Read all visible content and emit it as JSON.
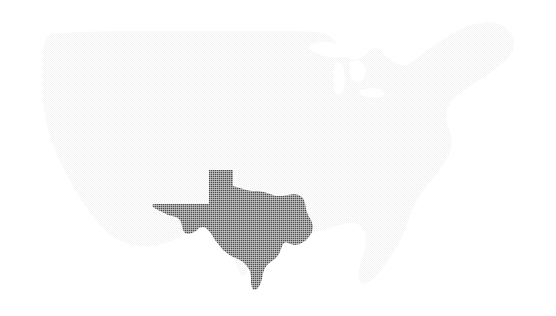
{
  "figure": {
    "name": "us-map-texas-highlighted",
    "background_color": "#ffffff",
    "width": 556,
    "height": 316,
    "texture": "halftone-screen",
    "visible_text": []
  },
  "regions": {
    "base": {
      "name": "contiguous-united-states",
      "label": "Contiguous United States",
      "fill_color": "#ececec",
      "stroke_color": "none",
      "highlighted": false
    },
    "highlight": {
      "name": "texas",
      "label": "Texas",
      "fill_color": "#4d4d4d",
      "stroke_color": "none",
      "highlighted": true
    },
    "lakes": {
      "name": "great-lakes",
      "label": "Great Lakes",
      "fill_color": "#ffffff"
    }
  },
  "legend": {
    "present": false,
    "items": [
      {
        "swatch_color": "#4d4d4d",
        "label": "Texas"
      },
      {
        "swatch_color": "#ececec",
        "label": "Other states"
      }
    ]
  },
  "geometry": {
    "usa_outline": "M 44 46 L 46 38 L 52 34 L 61 33 L 78 32 L 110 31 L 150 31 L 200 31 L 250 31 L 300 31 L 318 32 L 330 36 L 336 42 L 340 49 L 344 56 L 352 60 L 361 58 L 368 52 L 374 48 L 381 50 L 386 57 L 393 62 L 404 66 L 412 62 L 420 56 L 430 48 L 441 41 L 452 34 L 463 28 L 474 24 L 486 22 L 497 23 L 505 27 L 511 33 L 514 41 L 513 50 L 508 58 L 500 65 L 491 72 L 481 79 L 470 86 L 460 93 L 452 100 L 447 108 L 446 117 L 448 126 L 451 135 L 452 145 L 449 155 L 444 164 L 437 173 L 430 182 L 423 191 L 417 200 L 412 210 L 408 221 L 404 232 L 399 243 L 393 253 L 387 262 L 381 270 L 375 277 L 369 282 L 364 284 L 360 282 L 358 276 L 359 268 L 362 259 L 365 249 L 366 240 L 365 232 L 361 226 L 355 223 L 348 223 L 340 225 L 331 228 L 321 231 L 311 233 L 301 234 L 291 234 L 282 233 L 274 231 L 267 228 L 261 224 L 256 220 L 252 216 L 249 213 L 247 211 L 246 213 L 247 219 L 249 227 L 251 236 L 252 245 L 252 254 L 251 262 L 249 269 L 246 274 L 243 276 L 240 274 L 238 269 L 236 262 L 234 254 L 231 246 L 227 239 L 222 233 L 216 229 L 209 227 L 202 227 L 195 229 L 188 232 L 181 236 L 174 240 L 166 243 L 158 245 L 150 246 L 142 246 L 134 245 L 126 243 L 119 240 L 112 236 L 106 231 L 100 225 L 94 218 L 88 210 L 82 201 L 76 191 L 70 180 L 64 169 L 58 157 L 53 145 L 49 133 L 46 121 L 44 109 L 43 97 L 43 85 L 43 73 L 43 61 Z",
    "texas": "M 209 170 L 233 170 L 233 186 L 240 188 L 246 190 L 252 191 L 258 191 L 264 192 L 270 194 L 276 196 L 282 196 L 288 195 L 294 194 L 299 195 L 303 198 L 305 203 L 306 209 L 308 215 L 311 220 L 313 226 L 312 232 L 309 237 L 305 241 L 300 244 L 295 245 L 290 244 L 286 242 L 283 244 L 281 249 L 279 254 L 276 258 L 272 261 L 268 264 L 265 268 L 263 273 L 262 279 L 260 285 L 257 289 L 254 290 L 252 288 L 251 283 L 251 277 L 250 271 L 247 266 L 243 262 L 238 259 L 233 257 L 228 254 L 223 250 L 219 245 L 215 240 L 212 235 L 209 231 L 206 228 L 203 227 L 199 228 L 196 231 L 192 233 L 188 234 L 185 233 L 183 230 L 182 226 L 181 222 L 179 219 L 176 217 L 172 216 L 168 215 L 164 213 L 160 211 L 156 209 L 153 207 L 152 205 L 154 204 L 159 204 L 165 204 L 172 204 L 180 204 L 188 204 L 196 204 L 203 204 L 209 204 Z",
    "lake_superior": "M 311 44 L 322 42 L 334 43 L 344 47 L 348 53 L 344 57 L 335 58 L 324 56 L 314 52 L 309 48 Z",
    "lake_michigan": "M 336 62 L 341 63 L 344 70 L 345 79 L 344 88 L 341 94 L 337 95 L 334 90 L 333 81 L 333 71 Z",
    "lake_huron": "M 350 62 L 357 60 L 363 63 L 366 70 L 364 78 L 359 83 L 354 82 L 351 76 L 349 69 Z",
    "lake_erie_ontario": "M 360 90 L 371 88 L 380 89 L 385 93 L 382 97 L 373 98 L 364 96 L 359 93 Z"
  }
}
